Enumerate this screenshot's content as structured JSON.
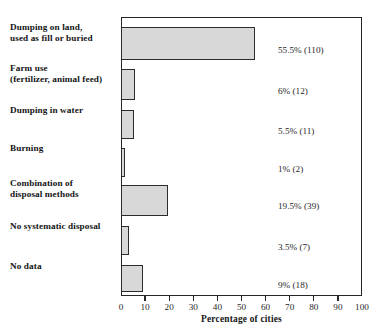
{
  "chart_data": {
    "type": "bar",
    "orientation": "horizontal",
    "title": "",
    "xlabel": "Percentage of cities",
    "ylabel": "",
    "xlim": [
      0,
      100
    ],
    "xticks": [
      0,
      10,
      20,
      30,
      40,
      50,
      60,
      70,
      80,
      90,
      100
    ],
    "grid": false,
    "legend": null,
    "categories": [
      "Dumping on land,\nused as fill or buried",
      "Farm use\n(fertilizer, animal feed)",
      "Dumping in water",
      "Burning",
      "Combination of\ndisposal methods",
      "No systematic disposal",
      "No data"
    ],
    "values": [
      55.5,
      6,
      5.5,
      1,
      19.5,
      3.5,
      9
    ],
    "counts": [
      110,
      12,
      11,
      2,
      39,
      7,
      18
    ],
    "value_labels": [
      "55.5% (110)",
      "6% (12)",
      "5.5% (11)",
      "1% (2)",
      "19.5% (39)",
      "3.5% (7)",
      "9% (18)"
    ],
    "bar_fill_color": "#d8d8d8",
    "bar_border_color": "#2b2b2b",
    "axis_color": "#262626"
  },
  "rows": [
    {
      "label_line1": "Dumping on land,",
      "label_line2": "used as fill or buried",
      "value_label": "55.5% (110)",
      "value": 55.5
    },
    {
      "label_line1": "Farm use",
      "label_line2": "(fertilizer, animal feed)",
      "value_label": "6% (12)",
      "value": 6
    },
    {
      "label_line1": "Dumping in water",
      "label_line2": "",
      "value_label": "5.5% (11)",
      "value": 5.5
    },
    {
      "label_line1": "Burning",
      "label_line2": "",
      "value_label": "1% (2)",
      "value": 1
    },
    {
      "label_line1": "Combination of",
      "label_line2": "disposal methods",
      "value_label": "19.5% (39)",
      "value": 19.5
    },
    {
      "label_line1": "No systematic disposal",
      "label_line2": "",
      "value_label": "3.5% (7)",
      "value": 3.5
    },
    {
      "label_line1": "No data",
      "label_line2": "",
      "value_label": "9% (18)",
      "value": 9
    }
  ],
  "axis": {
    "title": "Percentage of cities",
    "tick_labels": [
      "0",
      "10",
      "20",
      "30",
      "40",
      "50",
      "60",
      "70",
      "80",
      "90",
      "100"
    ]
  }
}
